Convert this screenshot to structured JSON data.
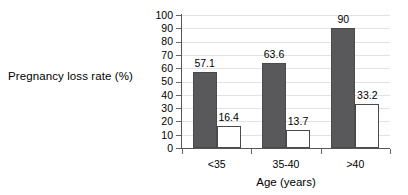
{
  "chart_data": {
    "type": "bar",
    "title": "",
    "subtitle": "",
    "xlabel": "Age (years)",
    "ylabel": "Pregnancy loss rate (%)",
    "categories": [
      "<35",
      "35-40",
      ">40"
    ],
    "series": [
      {
        "name": "series-1-filled",
        "values": [
          57.1,
          63.6,
          90
        ],
        "style": "filled-dark-gray",
        "color": "#59595b"
      },
      {
        "name": "series-2-open",
        "values": [
          16.4,
          13.7,
          33.2
        ],
        "style": "open-white",
        "color": "#ffffff"
      }
    ],
    "data_labels": [
      [
        "57.1",
        "16.4"
      ],
      [
        "63.6",
        "13.7"
      ],
      [
        "90",
        "33.2"
      ]
    ],
    "ylim": [
      0,
      100
    ],
    "ytick_values": [
      0,
      10,
      20,
      30,
      40,
      50,
      60,
      70,
      80,
      90,
      100
    ],
    "ytick_labels": [
      "0",
      "10",
      "20",
      "30",
      "40",
      "50",
      "60",
      "70",
      "80",
      "90",
      "100"
    ],
    "grid": true,
    "grid_axis": "y",
    "grid_color": "#e2e2e2",
    "legend": false,
    "legend_position": "none",
    "axis_color": "#555555"
  }
}
